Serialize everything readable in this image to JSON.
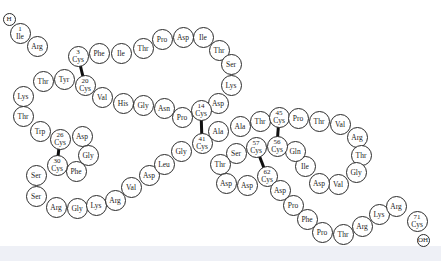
{
  "diagram": {
    "title": "",
    "terminals": [
      {
        "label": "H",
        "x": 9,
        "y": 19
      },
      {
        "label": "OH",
        "x": 423,
        "y": 240
      }
    ],
    "residues": [
      {
        "pos": "1",
        "label": "Ile",
        "x": 20,
        "y": 33
      },
      {
        "pos": "",
        "label": "Arg",
        "x": 37,
        "y": 46
      },
      {
        "pos": "3",
        "label": "Cys",
        "x": 78,
        "y": 56
      },
      {
        "pos": "",
        "label": "Phe",
        "x": 99,
        "y": 53
      },
      {
        "pos": "",
        "label": "Ile",
        "x": 121,
        "y": 53
      },
      {
        "pos": "",
        "label": "Thr",
        "x": 143,
        "y": 48
      },
      {
        "pos": "",
        "label": "Pro",
        "x": 162,
        "y": 39
      },
      {
        "pos": "",
        "label": "Asp",
        "x": 183,
        "y": 37
      },
      {
        "pos": "",
        "label": "Ile",
        "x": 203,
        "y": 37
      },
      {
        "pos": "",
        "label": "Thr",
        "x": 219,
        "y": 50
      },
      {
        "pos": "",
        "label": "Ser",
        "x": 231,
        "y": 64
      },
      {
        "pos": "",
        "label": "Lys",
        "x": 231,
        "y": 85
      },
      {
        "pos": "",
        "label": "Asp",
        "x": 218,
        "y": 103
      },
      {
        "pos": "14",
        "label": "Cys",
        "x": 201,
        "y": 110
      },
      {
        "pos": "",
        "label": "Pro",
        "x": 182,
        "y": 117
      },
      {
        "pos": "",
        "label": "Asn",
        "x": 164,
        "y": 108
      },
      {
        "pos": "",
        "label": "Gly",
        "x": 143,
        "y": 105
      },
      {
        "pos": "",
        "label": "His",
        "x": 123,
        "y": 103
      },
      {
        "pos": "",
        "label": "Val",
        "x": 102,
        "y": 97
      },
      {
        "pos": "20",
        "label": "Cys",
        "x": 85,
        "y": 85
      },
      {
        "pos": "",
        "label": "Tyr",
        "x": 64,
        "y": 79
      },
      {
        "pos": "",
        "label": "Thr",
        "x": 43,
        "y": 81
      },
      {
        "pos": "",
        "label": "Lys",
        "x": 23,
        "y": 96
      },
      {
        "pos": "",
        "label": "Thr",
        "x": 23,
        "y": 116
      },
      {
        "pos": "",
        "label": "Trp",
        "x": 40,
        "y": 131
      },
      {
        "pos": "26",
        "label": "Cys",
        "x": 60,
        "y": 139
      },
      {
        "pos": "",
        "label": "Asp",
        "x": 82,
        "y": 136
      },
      {
        "pos": "",
        "label": "Gly",
        "x": 88,
        "y": 155
      },
      {
        "pos": "",
        "label": "Phe",
        "x": 76,
        "y": 171
      },
      {
        "pos": "30",
        "label": "Cys",
        "x": 57,
        "y": 165
      },
      {
        "pos": "",
        "label": "Ser",
        "x": 36,
        "y": 175
      },
      {
        "pos": "",
        "label": "Ser",
        "x": 36,
        "y": 196
      },
      {
        "pos": "",
        "label": "Arg",
        "x": 56,
        "y": 207
      },
      {
        "pos": "",
        "label": "Gly",
        "x": 77,
        "y": 208
      },
      {
        "pos": "",
        "label": "Lys",
        "x": 96,
        "y": 205
      },
      {
        "pos": "",
        "label": "Arg",
        "x": 115,
        "y": 200
      },
      {
        "pos": "",
        "label": "Val",
        "x": 131,
        "y": 187
      },
      {
        "pos": "",
        "label": "Asp",
        "x": 149,
        "y": 175
      },
      {
        "pos": "",
        "label": "Leu",
        "x": 164,
        "y": 164
      },
      {
        "pos": "",
        "label": "Gly",
        "x": 181,
        "y": 151
      },
      {
        "pos": "41",
        "label": "Cys",
        "x": 202,
        "y": 143
      },
      {
        "pos": "",
        "label": "Ala",
        "x": 218,
        "y": 131
      },
      {
        "pos": "",
        "label": "Ala",
        "x": 240,
        "y": 126
      },
      {
        "pos": "",
        "label": "Thr",
        "x": 260,
        "y": 121
      },
      {
        "pos": "45",
        "label": "Cys",
        "x": 279,
        "y": 117
      },
      {
        "pos": "",
        "label": "Pro",
        "x": 298,
        "y": 118
      },
      {
        "pos": "",
        "label": "Thr",
        "x": 319,
        "y": 121
      },
      {
        "pos": "",
        "label": "Val",
        "x": 340,
        "y": 124
      },
      {
        "pos": "",
        "label": "Arg",
        "x": 357,
        "y": 137
      },
      {
        "pos": "",
        "label": "Thr",
        "x": 361,
        "y": 155
      },
      {
        "pos": "",
        "label": "Gly",
        "x": 356,
        "y": 172
      },
      {
        "pos": "",
        "label": "Val",
        "x": 338,
        "y": 184
      },
      {
        "pos": "",
        "label": "Asp",
        "x": 319,
        "y": 183
      },
      {
        "pos": "",
        "label": "Ile",
        "x": 305,
        "y": 166
      },
      {
        "pos": "",
        "label": "Gln",
        "x": 295,
        "y": 151
      },
      {
        "pos": "56",
        "label": "Cys",
        "x": 277,
        "y": 146
      },
      {
        "pos": "57",
        "label": "Cys",
        "x": 256,
        "y": 147
      },
      {
        "pos": "",
        "label": "Ser",
        "x": 236,
        "y": 153
      },
      {
        "pos": "",
        "label": "Thr",
        "x": 220,
        "y": 164
      },
      {
        "pos": "",
        "label": "Asp",
        "x": 226,
        "y": 183
      },
      {
        "pos": "",
        "label": "Asp",
        "x": 247,
        "y": 185
      },
      {
        "pos": "62",
        "label": "Cys",
        "x": 267,
        "y": 176
      },
      {
        "pos": "",
        "label": "Asp",
        "x": 280,
        "y": 190
      },
      {
        "pos": "",
        "label": "Pro",
        "x": 293,
        "y": 205
      },
      {
        "pos": "",
        "label": "Phe",
        "x": 307,
        "y": 219
      },
      {
        "pos": "",
        "label": "Pro",
        "x": 322,
        "y": 232
      },
      {
        "pos": "",
        "label": "Thr",
        "x": 343,
        "y": 234
      },
      {
        "pos": "",
        "label": "Arg",
        "x": 362,
        "y": 226
      },
      {
        "pos": "",
        "label": "Lys",
        "x": 379,
        "y": 214
      },
      {
        "pos": "",
        "label": "Arg",
        "x": 396,
        "y": 206
      },
      {
        "pos": "71",
        "label": "Cys",
        "x": 417,
        "y": 221
      }
    ],
    "disulfide_bonds": [
      {
        "from": "3",
        "to": "20"
      },
      {
        "from": "14",
        "to": "41"
      },
      {
        "from": "26",
        "to": "30"
      },
      {
        "from": "45",
        "to": "56"
      },
      {
        "from": "57",
        "to": "62"
      }
    ],
    "colors": {
      "circle_stroke": "#2a2a2a",
      "bond": "#111111",
      "text": "#222222",
      "band": "#eef0f6"
    }
  }
}
